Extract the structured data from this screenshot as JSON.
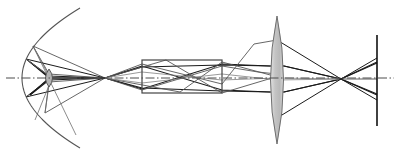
{
  "figure": {
    "type": "optical-ray-diagram",
    "width": 400,
    "height": 156,
    "background_color": "#ffffff"
  },
  "colors": {
    "ray_dark": "#1a1a1a",
    "ray_mid": "#555555",
    "ray_light": "#808080",
    "outline": "#333333",
    "axis": "#4d4d4d",
    "lens_fill_light": "#cccccc",
    "lens_fill_dark": "#999999",
    "mirror_stroke": "#555555",
    "box_stroke": "#444444",
    "plane_stroke": "#111111"
  },
  "optical_axis": {
    "label": "optical-axis",
    "y": 78,
    "x_start": 6,
    "x_end": 394,
    "style": "dash-dot",
    "color": "#4d4d4d",
    "width": 1
  },
  "elements": [
    {
      "id": "concave-mirror",
      "label": "Concave mirror",
      "kind": "arc",
      "vertex_x": 22,
      "center_y": 78,
      "radius_x": 58,
      "radius_y": 70,
      "y_top": 10,
      "y_bottom": 148,
      "stroke": "#555555",
      "stroke_width": 1.1
    },
    {
      "id": "field-lens",
      "label": "Small field lens",
      "kind": "lens-biconvex",
      "center_x": 49,
      "center_y": 78,
      "half_width": 3.5,
      "half_height": 9,
      "fill": "#b3b3b3",
      "stroke": "#4d4d4d"
    },
    {
      "id": "prism-block",
      "label": "Rectangular optical block",
      "kind": "rectangle",
      "x": 142,
      "y": 60,
      "width": 80,
      "height": 33,
      "stroke": "#444444",
      "stroke_width": 1.2,
      "fill": "none"
    },
    {
      "id": "objective-lens",
      "label": "Large biconvex objective lens",
      "kind": "lens-biconvex",
      "center_x": 277,
      "center_y": 80,
      "half_width": 6.5,
      "half_height": 64,
      "fill": "#c4c4c4",
      "stroke": "#6e6e6e"
    },
    {
      "id": "image-plane",
      "label": "Image plane",
      "kind": "vertical-line",
      "x": 377,
      "y_top": 35,
      "y_bottom": 126,
      "stroke": "#111111",
      "stroke_width": 1.6
    }
  ],
  "focal_points": [
    {
      "id": "intermediate-focus-1",
      "label": "Intermediate focus",
      "x": 105,
      "y": 78
    },
    {
      "id": "intermediate-focus-2",
      "label": "Block exit focus",
      "x": 224,
      "y": 81
    },
    {
      "id": "final-focus",
      "label": "Final focus",
      "x": 341,
      "y": 79
    }
  ],
  "ray_bundles": [
    {
      "id": "bundle-marginal-upper",
      "label": "Upper marginal rays",
      "color": "#1a1a1a",
      "width": 1.1,
      "polylines": [
        [
          [
            30,
            62
          ],
          [
            49,
            76
          ],
          [
            105,
            78
          ],
          [
            142,
            66
          ],
          [
            222,
            90
          ],
          [
            270,
            92
          ],
          [
            284,
            92
          ],
          [
            341,
            79
          ],
          [
            377,
            62
          ]
        ],
        [
          [
            30,
            62
          ],
          [
            49,
            78
          ],
          [
            105,
            78
          ],
          [
            142,
            89
          ],
          [
            222,
            64
          ],
          [
            270,
            66
          ],
          [
            284,
            66
          ],
          [
            341,
            79
          ],
          [
            377,
            95
          ]
        ]
      ]
    },
    {
      "id": "bundle-marginal-lower",
      "label": "Lower marginal rays",
      "color": "#1a1a1a",
      "width": 1.1,
      "polylines": [
        [
          [
            30,
            95
          ],
          [
            49,
            80
          ],
          [
            105,
            78
          ],
          [
            142,
            88
          ],
          [
            222,
            91
          ],
          [
            270,
            92
          ],
          [
            284,
            92
          ],
          [
            341,
            79
          ],
          [
            377,
            63
          ]
        ],
        [
          [
            30,
            95
          ],
          [
            49,
            78
          ],
          [
            105,
            78
          ],
          [
            142,
            67
          ],
          [
            222,
            65
          ],
          [
            270,
            66
          ],
          [
            284,
            66
          ],
          [
            341,
            79
          ],
          [
            377,
            94
          ]
        ]
      ]
    },
    {
      "id": "bundle-chief-upper",
      "label": "Upper chief ray fan",
      "color": "#555555",
      "width": 0.9,
      "polylines": [
        [
          [
            33,
            46
          ],
          [
            105,
            78
          ],
          [
            142,
            64
          ],
          [
            222,
            84
          ],
          [
            254,
            44
          ],
          [
            277,
            40
          ]
        ],
        [
          [
            33,
            46
          ],
          [
            49,
            74
          ],
          [
            105,
            78
          ],
          [
            166,
            60
          ],
          [
            222,
            93
          ],
          [
            272,
            78
          ]
        ]
      ]
    },
    {
      "id": "bundle-chief-lower",
      "label": "Lower chief ray fan",
      "color": "#555555",
      "width": 0.9,
      "polylines": [
        [
          [
            45,
            113
          ],
          [
            105,
            78
          ],
          [
            142,
            90
          ],
          [
            222,
            66
          ],
          [
            258,
            72
          ],
          [
            277,
            74
          ]
        ],
        [
          [
            45,
            113
          ],
          [
            49,
            82
          ],
          [
            105,
            78
          ],
          [
            180,
            92
          ],
          [
            222,
            62
          ],
          [
            274,
            76
          ]
        ]
      ]
    },
    {
      "id": "bundle-mirror-return-upper",
      "label": "Mirror return rays upper",
      "color": "#1a1a1a",
      "width": 1.0,
      "polylines": [
        [
          [
            26,
            59
          ],
          [
            49,
            77
          ],
          [
            26,
            59
          ]
        ],
        [
          [
            26,
            59
          ],
          [
            105,
            78
          ]
        ],
        [
          [
            26,
            97
          ],
          [
            105,
            78
          ]
        ],
        [
          [
            26,
            97
          ],
          [
            49,
            79
          ]
        ]
      ]
    },
    {
      "id": "bundle-mirror-edge",
      "label": "Mirror edge rays",
      "color": "#6e6e6e",
      "width": 0.8,
      "polylines": [
        [
          [
            33,
            46
          ],
          [
            50,
            78
          ],
          [
            45,
            113
          ]
        ],
        [
          [
            26,
            59
          ],
          [
            52,
            78
          ],
          [
            35,
            120
          ]
        ],
        [
          [
            33,
            46
          ],
          [
            76,
            135
          ]
        ]
      ]
    },
    {
      "id": "bundle-axial-thin",
      "label": "Thin axial rays through block",
      "color": "#808080",
      "width": 0.8,
      "polylines": [
        [
          [
            105,
            78
          ],
          [
            142,
            72
          ],
          [
            222,
            80
          ],
          [
            277,
            78
          ],
          [
            341,
            79
          ],
          [
            377,
            79
          ]
        ],
        [
          [
            105,
            78
          ],
          [
            142,
            83
          ],
          [
            222,
            74
          ],
          [
            277,
            80
          ],
          [
            341,
            79
          ],
          [
            377,
            79
          ]
        ]
      ]
    },
    {
      "id": "bundle-lens-to-plane",
      "label": "Converging rays to image plane",
      "color": "#1a1a1a",
      "width": 1.0,
      "polylines": [
        [
          [
            277,
            40
          ],
          [
            341,
            79
          ],
          [
            377,
            100
          ]
        ],
        [
          [
            277,
            118
          ],
          [
            341,
            79
          ],
          [
            377,
            58
          ]
        ]
      ]
    }
  ],
  "annotations": {
    "has_labels": false,
    "has_text": false,
    "note": "Purely graphical ray diagram with no visible text labels."
  }
}
